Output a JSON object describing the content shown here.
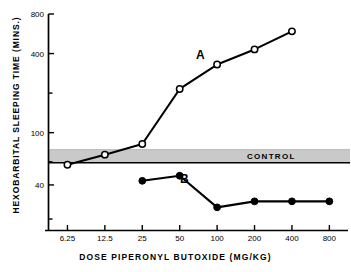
{
  "chart_data": {
    "type": "line",
    "title": "",
    "xlabel": "DOSE  PIPERONYL  BUTOXIDE  (MG/KG)",
    "ylabel": "HEXOBARBITAL  SLEEPING  TIME  (MINS.)",
    "xscale": "log",
    "yscale": "log",
    "xlim": [
      4.4,
      1130
    ],
    "ylim": [
      18,
      800
    ],
    "grid": false,
    "legend": "inline-labels",
    "x_ticks": [
      "6.25",
      "12.5",
      "25",
      "50",
      "100",
      "200",
      "400",
      "800"
    ],
    "x_tick_values": [
      6.25,
      12.5,
      25,
      50,
      100,
      200,
      400,
      800
    ],
    "y_ticks": [
      "800",
      "400",
      "100",
      "40"
    ],
    "y_tick_values": [
      800,
      400,
      100,
      40
    ],
    "y_minor_tick_values": [
      200,
      60
    ],
    "series": [
      {
        "name": "A",
        "marker": "open-circle",
        "color": "#000000",
        "x": [
          6.25,
          12.5,
          25,
          50,
          100,
          200,
          400
        ],
        "values": [
          57,
          68,
          82,
          215,
          330,
          430,
          590
        ]
      },
      {
        "name": "B",
        "marker": "filled-circle",
        "color": "#000000",
        "x": [
          25,
          50,
          100,
          200,
          400,
          800
        ],
        "values": [
          43,
          47,
          27,
          30,
          30,
          30
        ]
      }
    ],
    "bands": [
      {
        "label": "CONTROL",
        "orientation": "horizontal",
        "y_low": 41,
        "y_high": 49,
        "fill": "#c7c7c7"
      }
    ],
    "annotations": [
      {
        "text": "A",
        "x": 40,
        "y": 300
      },
      {
        "text": "B",
        "x": 62,
        "y": 36
      },
      {
        "text": "CONTROL",
        "x": 300,
        "y": 46
      }
    ]
  },
  "axes": {
    "y_axis_name": "hexobarbital-sleeping-time",
    "x_axis_name": "dose-piperonyl-butoxide"
  }
}
